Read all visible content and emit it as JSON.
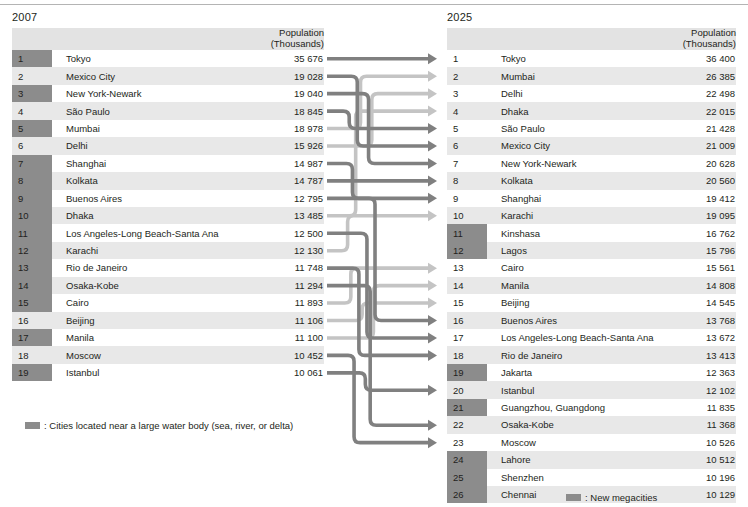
{
  "left": {
    "year": "2007",
    "header": {
      "line1": "Population",
      "line2": "(Thousands)"
    },
    "rows": [
      {
        "rank": "1",
        "city": "Tokyo",
        "pop": "35 676",
        "highlight": true
      },
      {
        "rank": "2",
        "city": "Mexico City",
        "pop": "19 028",
        "highlight": false
      },
      {
        "rank": "3",
        "city": "New York-Newark",
        "pop": "19 040",
        "highlight": true
      },
      {
        "rank": "4",
        "city": "São Paulo",
        "pop": "18 845",
        "highlight": false
      },
      {
        "rank": "5",
        "city": "Mumbai",
        "pop": "18 978",
        "highlight": true
      },
      {
        "rank": "6",
        "city": "Delhi",
        "pop": "15 926",
        "highlight": false
      },
      {
        "rank": "7",
        "city": "Shanghai",
        "pop": "14 987",
        "highlight": true
      },
      {
        "rank": "8",
        "city": "Kolkata",
        "pop": "14 787",
        "highlight": true
      },
      {
        "rank": "9",
        "city": "Buenos Aires",
        "pop": "12 795",
        "highlight": true
      },
      {
        "rank": "10",
        "city": "Dhaka",
        "pop": "13 485",
        "highlight": true
      },
      {
        "rank": "11",
        "city": "Los Angeles-Long Beach-Santa Ana",
        "pop": "12 500",
        "highlight": true
      },
      {
        "rank": "12",
        "city": "Karachi",
        "pop": "12 130",
        "highlight": true
      },
      {
        "rank": "13",
        "city": "Rio de Janeiro",
        "pop": "11 748",
        "highlight": true
      },
      {
        "rank": "14",
        "city": "Osaka-Kobe",
        "pop": "11 294",
        "highlight": true
      },
      {
        "rank": "15",
        "city": "Cairo",
        "pop": "11 893",
        "highlight": true
      },
      {
        "rank": "16",
        "city": "Beijing",
        "pop": "11 106",
        "highlight": false
      },
      {
        "rank": "17",
        "city": "Manila",
        "pop": "11 100",
        "highlight": true
      },
      {
        "rank": "18",
        "city": "Moscow",
        "pop": "10 452",
        "highlight": false
      },
      {
        "rank": "19",
        "city": "Istanbul",
        "pop": "10 061",
        "highlight": true
      }
    ],
    "legend": {
      "text": ": Cities located near a large water body (sea, river, or delta)"
    }
  },
  "right": {
    "year": "2025",
    "header": {
      "line1": "Population",
      "line2": "(Thousands)"
    },
    "rows": [
      {
        "rank": "1",
        "city": "Tokyo",
        "pop": "36 400",
        "highlight": false
      },
      {
        "rank": "2",
        "city": "Mumbai",
        "pop": "26 385",
        "highlight": false
      },
      {
        "rank": "3",
        "city": "Delhi",
        "pop": "22 498",
        "highlight": false
      },
      {
        "rank": "4",
        "city": "Dhaka",
        "pop": "22 015",
        "highlight": false
      },
      {
        "rank": "5",
        "city": "São Paulo",
        "pop": "21 428",
        "highlight": false
      },
      {
        "rank": "6",
        "city": "Mexico City",
        "pop": "21 009",
        "highlight": false
      },
      {
        "rank": "7",
        "city": "New York-Newark",
        "pop": "20 628",
        "highlight": false
      },
      {
        "rank": "8",
        "city": "Kolkata",
        "pop": "20 560",
        "highlight": false
      },
      {
        "rank": "9",
        "city": "Shanghai",
        "pop": "19 412",
        "highlight": false
      },
      {
        "rank": "10",
        "city": "Karachi",
        "pop": "19 095",
        "highlight": false
      },
      {
        "rank": "11",
        "city": "Kinshasa",
        "pop": "16 762",
        "highlight": true
      },
      {
        "rank": "12",
        "city": "Lagos",
        "pop": "15 796",
        "highlight": true
      },
      {
        "rank": "13",
        "city": "Cairo",
        "pop": "15 561",
        "highlight": false
      },
      {
        "rank": "14",
        "city": "Manila",
        "pop": "14 808",
        "highlight": false
      },
      {
        "rank": "15",
        "city": "Beijing",
        "pop": "14 545",
        "highlight": false
      },
      {
        "rank": "16",
        "city": "Buenos Aires",
        "pop": "13 768",
        "highlight": false
      },
      {
        "rank": "17",
        "city": "Los Angeles-Long Beach-Santa Ana",
        "pop": "13 672",
        "highlight": false
      },
      {
        "rank": "18",
        "city": "Rio de Janeiro",
        "pop": "13 413",
        "highlight": false
      },
      {
        "rank": "19",
        "city": "Jakarta",
        "pop": "12 363",
        "highlight": true
      },
      {
        "rank": "20",
        "city": "Istanbul",
        "pop": "12 102",
        "highlight": false
      },
      {
        "rank": "21",
        "city": "Guangzhou, Guangdong",
        "pop": "11 835",
        "highlight": true
      },
      {
        "rank": "22",
        "city": "Osaka-Kobe",
        "pop": "11 368",
        "highlight": false
      },
      {
        "rank": "23",
        "city": "Moscow",
        "pop": "10 526",
        "highlight": false
      },
      {
        "rank": "24",
        "city": "Lahore",
        "pop": "10 512",
        "highlight": true
      },
      {
        "rank": "25",
        "city": "Shenzhen",
        "pop": "10 196",
        "highlight": true
      },
      {
        "rank": "26",
        "city": "Chennai",
        "pop": "10 129",
        "highlight": true
      }
    ],
    "legend": {
      "text": ": New megacities"
    }
  },
  "colors": {
    "dark_flow": "#808080",
    "light_flow": "#c4c4c4",
    "rank_highlight": "#8c8c8c",
    "row_even": "#e8e8e8",
    "row_odd": "#ffffff",
    "header_band": "#e3e3e3",
    "text": "#231f20"
  },
  "chart_data": {
    "type": "diagram",
    "flows": [
      {
        "city": "Tokyo",
        "from_rank": 1,
        "to_rank": 1,
        "tone": "dark"
      },
      {
        "city": "Mexico City",
        "from_rank": 2,
        "to_rank": 6,
        "tone": "dark"
      },
      {
        "city": "New York-Newark",
        "from_rank": 3,
        "to_rank": 7,
        "tone": "dark"
      },
      {
        "city": "São Paulo",
        "from_rank": 4,
        "to_rank": 5,
        "tone": "dark"
      },
      {
        "city": "Mumbai",
        "from_rank": 5,
        "to_rank": 2,
        "tone": "light"
      },
      {
        "city": "Delhi",
        "from_rank": 6,
        "to_rank": 3,
        "tone": "light"
      },
      {
        "city": "Shanghai",
        "from_rank": 7,
        "to_rank": 9,
        "tone": "dark"
      },
      {
        "city": "Kolkata",
        "from_rank": 8,
        "to_rank": 8,
        "tone": "dark"
      },
      {
        "city": "Buenos Aires",
        "from_rank": 9,
        "to_rank": 16,
        "tone": "dark"
      },
      {
        "city": "Dhaka",
        "from_rank": 10,
        "to_rank": 4,
        "tone": "light"
      },
      {
        "city": "Los Angeles-Long Beach-Santa Ana",
        "from_rank": 11,
        "to_rank": 17,
        "tone": "dark"
      },
      {
        "city": "Karachi",
        "from_rank": 12,
        "to_rank": 10,
        "tone": "light"
      },
      {
        "city": "Rio de Janeiro",
        "from_rank": 13,
        "to_rank": 18,
        "tone": "dark"
      },
      {
        "city": "Osaka-Kobe",
        "from_rank": 14,
        "to_rank": 22,
        "tone": "dark"
      },
      {
        "city": "Cairo",
        "from_rank": 15,
        "to_rank": 13,
        "tone": "light"
      },
      {
        "city": "Beijing",
        "from_rank": 16,
        "to_rank": 15,
        "tone": "light"
      },
      {
        "city": "Manila",
        "from_rank": 17,
        "to_rank": 14,
        "tone": "light"
      },
      {
        "city": "Moscow",
        "from_rank": 18,
        "to_rank": 23,
        "tone": "dark"
      },
      {
        "city": "Istanbul",
        "from_rank": 19,
        "to_rank": 20,
        "tone": "dark"
      }
    ]
  }
}
